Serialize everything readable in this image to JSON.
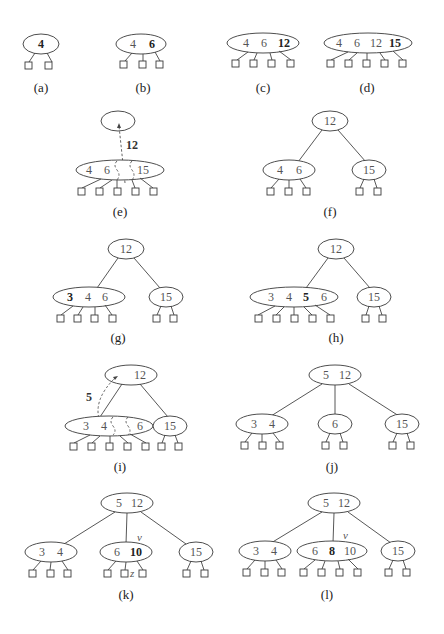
{
  "figure": {
    "panels": [
      {
        "id": "a",
        "caption": "(a)",
        "nodes": [
          {
            "keys": [
              "4"
            ],
            "bold": [
              "4"
            ]
          }
        ]
      },
      {
        "id": "b",
        "caption": "(b)",
        "nodes": [
          {
            "keys": [
              "4",
              "6"
            ],
            "bold": [
              "6"
            ]
          }
        ]
      },
      {
        "id": "c",
        "caption": "(c)",
        "nodes": [
          {
            "keys": [
              "4",
              "6",
              "12"
            ],
            "bold": [
              "12"
            ]
          }
        ]
      },
      {
        "id": "d",
        "caption": "(d)",
        "nodes": [
          {
            "keys": [
              "4",
              "6",
              "12",
              "15"
            ],
            "bold": [
              "15"
            ]
          }
        ]
      },
      {
        "id": "e",
        "caption": "(e)",
        "nodes": [
          {
            "keys": []
          },
          {
            "keys": [
              "4",
              "6",
              "15"
            ]
          }
        ],
        "moving_key": "12"
      },
      {
        "id": "f",
        "caption": "(f)",
        "nodes": [
          {
            "keys": [
              "12"
            ]
          },
          {
            "keys": [
              "4",
              "6"
            ]
          },
          {
            "keys": [
              "15"
            ]
          }
        ]
      },
      {
        "id": "g",
        "caption": "(g)",
        "nodes": [
          {
            "keys": [
              "12"
            ]
          },
          {
            "keys": [
              "3",
              "4",
              "6"
            ],
            "bold": [
              "3"
            ]
          },
          {
            "keys": [
              "15"
            ]
          }
        ]
      },
      {
        "id": "h",
        "caption": "(h)",
        "nodes": [
          {
            "keys": [
              "12"
            ]
          },
          {
            "keys": [
              "3",
              "4",
              "5",
              "6"
            ],
            "bold": [
              "5"
            ]
          },
          {
            "keys": [
              "15"
            ]
          }
        ]
      },
      {
        "id": "i",
        "caption": "(i)",
        "nodes": [
          {
            "keys": [
              "12"
            ]
          },
          {
            "keys": [
              "3",
              "4",
              "6"
            ]
          },
          {
            "keys": [
              "15"
            ]
          }
        ],
        "moving_key": "5"
      },
      {
        "id": "j",
        "caption": "(j)",
        "nodes": [
          {
            "keys": [
              "5",
              "12"
            ]
          },
          {
            "keys": [
              "3",
              "4"
            ]
          },
          {
            "keys": [
              "6"
            ]
          },
          {
            "keys": [
              "15"
            ]
          }
        ]
      },
      {
        "id": "k",
        "caption": "(k)",
        "nodes": [
          {
            "keys": [
              "5",
              "12"
            ]
          },
          {
            "keys": [
              "3",
              "4"
            ]
          },
          {
            "keys": [
              "6",
              "10"
            ],
            "bold": [
              "10"
            ]
          },
          {
            "keys": [
              "15"
            ]
          }
        ],
        "labels": [
          "v",
          "z"
        ]
      },
      {
        "id": "l",
        "caption": "(l)",
        "nodes": [
          {
            "keys": [
              "5",
              "12"
            ]
          },
          {
            "keys": [
              "3",
              "4"
            ]
          },
          {
            "keys": [
              "6",
              "8",
              "10"
            ],
            "bold": [
              "8"
            ]
          },
          {
            "keys": [
              "15"
            ]
          }
        ],
        "labels": [
          "v"
        ]
      }
    ]
  },
  "t": {
    "k4": "4",
    "k6": "6",
    "k12": "12",
    "k15": "15",
    "k3": "3",
    "k5": "5",
    "k8": "8",
    "k10": "10",
    "v": "v",
    "z": "z",
    "ca": "(a)",
    "cb": "(b)",
    "cc": "(c)",
    "cd": "(d)",
    "ce": "(e)",
    "cf": "(f)",
    "cg": "(g)",
    "ch": "(h)",
    "ci": "(i)",
    "cj": "(j)",
    "ck": "(k)",
    "cl": "(l)"
  }
}
